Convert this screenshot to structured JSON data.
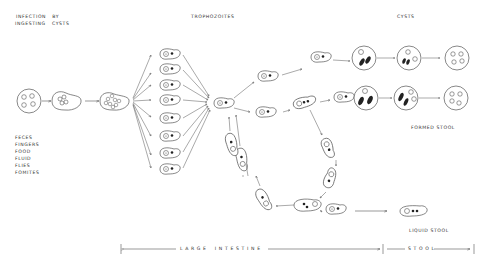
{
  "labels": {
    "infection_line1": "INFECTION   BY",
    "infection_line2": "INGESTING   CYSTS",
    "trophozoites": "TROPHOZOITES",
    "cysts": "CYSTS",
    "sources": [
      "FECES",
      "FINGERS",
      "FOOD",
      "FLUID",
      "FLIES",
      "FOMITES"
    ],
    "formed_stool": "FORMED STOOL",
    "liquid_stool": "LIQUID STOOL",
    "large_intestine": "L A R G E    I N T E S T I N E",
    "stool": "S T O O L"
  },
  "stages": {
    "ingested_cyst_nuclei": 4,
    "excysting_trophozoites": 8,
    "cyst_rows": 2,
    "cyst_stages_per_row": 3
  },
  "colors": {
    "line": "#555555",
    "fill": "#ffffff",
    "dot": "#222222"
  }
}
